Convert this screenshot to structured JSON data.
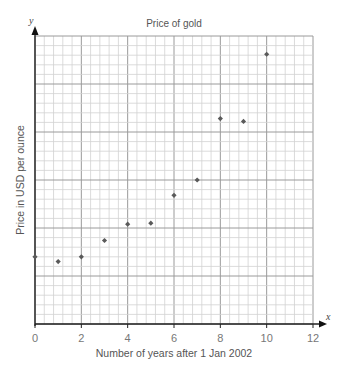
{
  "chart_data": {
    "type": "scatter",
    "title": "Price of gold",
    "xlabel": "Number of years after 1 Jan 2002",
    "ylabel": "Price in USD per ounce",
    "x_axis_letter": "x",
    "y_axis_letter": "y",
    "xlim": [
      0,
      12
    ],
    "x_ticks": [
      0,
      2,
      4,
      6,
      8,
      10,
      12
    ],
    "x_tick_labels": [
      "0",
      "2",
      "4",
      "6",
      "8",
      "10",
      "12"
    ],
    "x_minor_per_unit": 2.5,
    "y_units": "grid squares above x-axis (no y scale printed)",
    "ylim": [
      0,
      30
    ],
    "y_major_every": 5,
    "y_tick_labels": [],
    "grid": true,
    "legend": "none",
    "points": [
      {
        "x": 0,
        "y": 7.0
      },
      {
        "x": 1,
        "y": 6.5
      },
      {
        "x": 2,
        "y": 7.0
      },
      {
        "x": 3,
        "y": 8.7
      },
      {
        "x": 4,
        "y": 10.4
      },
      {
        "x": 5,
        "y": 10.5
      },
      {
        "x": 6,
        "y": 13.4
      },
      {
        "x": 7,
        "y": 15.0
      },
      {
        "x": 8,
        "y": 21.4
      },
      {
        "x": 9,
        "y": 21.1
      },
      {
        "x": 10,
        "y": 28.1
      }
    ],
    "colors": {
      "point": "#5a5a5a",
      "minor_grid": "#d2d2d2",
      "major_grid": "#9a9a9a",
      "axis": "#222222"
    }
  }
}
